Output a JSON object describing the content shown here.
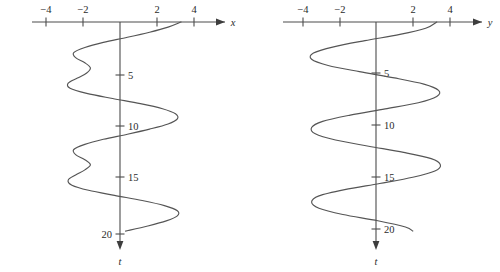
{
  "figure": {
    "caption": "",
    "background_color": "#ffffff",
    "curve_color": "#555555",
    "axis_color": "#4c4c4c",
    "text_color": "#2b2b2b",
    "width": 500,
    "height": 272
  },
  "panels": [
    {
      "id": "left-panel",
      "name": "displacement-vs-time-plot",
      "horizontal_axis_label": "x",
      "vertical_axis_label": "t",
      "horizontal_ticks": [
        {
          "value": -4,
          "label": "−4"
        },
        {
          "value": -2,
          "label": "−2"
        },
        {
          "value": 2,
          "label": "2"
        },
        {
          "value": 4,
          "label": "4"
        }
      ],
      "vertical_ticks": [
        {
          "value": 5,
          "label": "5",
          "label_side": "right"
        },
        {
          "value": 10,
          "label": "10",
          "label_side": "right"
        },
        {
          "value": 15,
          "label": "15",
          "label_side": "right"
        },
        {
          "value": 20,
          "label": "20",
          "label_side": "left"
        }
      ]
    },
    {
      "id": "right-panel",
      "name": "velocity-vs-time-plot",
      "horizontal_axis_label": "y",
      "vertical_axis_label": "t",
      "horizontal_ticks": [
        {
          "value": -4,
          "label": "−4"
        },
        {
          "value": -2,
          "label": "−2"
        },
        {
          "value": 2,
          "label": "2"
        },
        {
          "value": 4,
          "label": "4"
        }
      ],
      "vertical_ticks": [
        {
          "value": 5,
          "label": "5",
          "label_side": "right"
        },
        {
          "value": 10,
          "label": "10",
          "label_side": "right"
        },
        {
          "value": 15,
          "label": "15",
          "label_side": "right"
        },
        {
          "value": 20,
          "label": "20",
          "label_side": "right"
        }
      ]
    }
  ],
  "chart_data": {
    "type": "line",
    "title": "",
    "subtitle": "",
    "orientation": "vertical-time-axis",
    "grid": false,
    "legend": null,
    "charts": [
      {
        "id": "left",
        "name": "x-vs-t",
        "xlabel": "x",
        "ylabel": "t",
        "xlim": [
          -5.2,
          5.2
        ],
        "ylim": [
          0,
          21.5
        ],
        "xticks": [
          -4,
          -2,
          2,
          4
        ],
        "yticks": [
          5,
          10,
          15,
          20
        ],
        "series": [
          {
            "name": "x(t)",
            "model": "two-frequency beat, amplitude about 3",
            "t": [
              0.0,
              0.5,
              1.0,
              1.5,
              2.0,
              2.5,
              3.0,
              3.5,
              4.0,
              4.5,
              5.0,
              5.5,
              6.0,
              6.5,
              7.0,
              7.5,
              8.0,
              8.5,
              9.0,
              9.5,
              10.0,
              10.5,
              11.0,
              11.5,
              12.0,
              12.5,
              13.0,
              13.5,
              14.0,
              14.5,
              15.0,
              15.5,
              16.0,
              16.5,
              17.0,
              17.5,
              18.0,
              18.5,
              19.0,
              19.5,
              20.0,
              20.5
            ],
            "x": [
              3.3,
              2.6,
              1.6,
              0.4,
              -0.9,
              -1.9,
              -2.5,
              -2.4,
              -1.9,
              -1.6,
              -1.8,
              -2.3,
              -2.8,
              -2.7,
              -1.8,
              -0.4,
              1.1,
              2.3,
              3.0,
              3.1,
              2.6,
              1.6,
              0.4,
              -0.9,
              -1.9,
              -2.5,
              -2.4,
              -1.9,
              -1.6,
              -1.9,
              -2.4,
              -2.8,
              -2.6,
              -1.7,
              -0.3,
              1.2,
              2.4,
              3.1,
              3.1,
              2.5,
              1.5,
              0.3
            ]
          }
        ]
      },
      {
        "id": "right",
        "name": "y-vs-t",
        "xlabel": "y",
        "ylabel": "t",
        "xlim": [
          -5.2,
          5.2
        ],
        "ylim": [
          0,
          21.5
        ],
        "xticks": [
          -4,
          -2,
          2,
          4
        ],
        "yticks": [
          5,
          10,
          15,
          20
        ],
        "series": [
          {
            "name": "y(t)",
            "model": "sinusoid, period about 5, amplitude about 3.3",
            "t": [
              0.0,
              0.6,
              1.2,
              1.8,
              2.4,
              3.0,
              3.6,
              4.2,
              4.8,
              5.4,
              6.0,
              6.6,
              7.2,
              7.8,
              8.4,
              9.0,
              9.6,
              10.2,
              10.8,
              11.4,
              12.0,
              12.6,
              13.2,
              13.8,
              14.4,
              15.0,
              15.6,
              16.2,
              16.8,
              17.4,
              18.0,
              18.6,
              19.2,
              19.8,
              20.2
            ],
            "y": [
              3.3,
              2.7,
              1.3,
              -0.6,
              -2.3,
              -3.4,
              -3.5,
              -2.6,
              -0.9,
              1.0,
              2.6,
              3.4,
              3.3,
              2.3,
              0.5,
              -1.4,
              -2.9,
              -3.5,
              -3.3,
              -2.2,
              -0.4,
              1.5,
              3.0,
              3.5,
              3.2,
              2.0,
              0.2,
              -1.7,
              -3.1,
              -3.5,
              -3.1,
              -1.8,
              0.1,
              1.6,
              2.0
            ]
          }
        ]
      }
    ]
  }
}
